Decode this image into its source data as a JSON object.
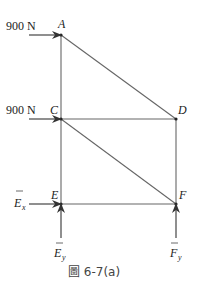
{
  "figure": {
    "caption": "圖 6-7(a)",
    "caption_prefix": "圖",
    "caption_number": "6-7(a)"
  },
  "joints": [
    {
      "name": "A",
      "x": 61,
      "y": 35
    },
    {
      "name": "C",
      "x": 61,
      "y": 119
    },
    {
      "name": "D",
      "x": 176,
      "y": 119
    },
    {
      "name": "E",
      "x": 61,
      "y": 204
    },
    {
      "name": "F",
      "x": 176,
      "y": 204
    }
  ],
  "members": [
    "AC",
    "AD",
    "CD",
    "CE",
    "CF",
    "DF",
    "EF"
  ],
  "loads": [
    {
      "label": "900 N",
      "at": "A",
      "direction": "right"
    },
    {
      "label": "900 N",
      "at": "C",
      "direction": "right"
    }
  ],
  "reactions": [
    {
      "label": "E",
      "subscript": "x",
      "at": "E",
      "direction": "right"
    },
    {
      "label": "E",
      "subscript": "y",
      "at": "E",
      "direction": "up"
    },
    {
      "label": "F",
      "subscript": "y",
      "at": "F",
      "direction": "up"
    }
  ],
  "colors": {
    "member": "#666666",
    "arrow": "#333333",
    "text": "#222222"
  }
}
